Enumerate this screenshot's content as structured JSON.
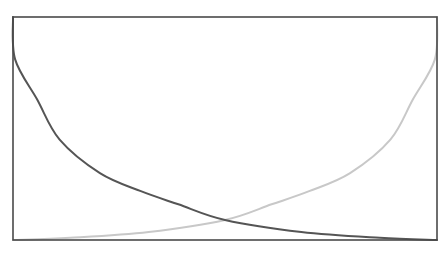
{
  "chart_data": {
    "type": "line",
    "title": "",
    "xlabel": "",
    "ylabel": "",
    "xlim": [
      0,
      1
    ],
    "ylim": [
      0,
      1
    ],
    "grid": false,
    "legend": null,
    "frame": {
      "left": 13,
      "top": 17,
      "right": 437,
      "bottom": 240,
      "color": "#4a4a4a"
    },
    "x": [
      0.0,
      0.005,
      0.057,
      0.11,
      0.205,
      0.3,
      0.39,
      0.5,
      0.68,
      0.865,
      1.0
    ],
    "series": [
      {
        "name": "decreasing",
        "color": "#555555",
        "values": [
          1.0,
          0.81,
          0.63,
          0.45,
          0.3,
          0.22,
          0.16,
          0.09,
          0.036,
          0.01,
          0.0
        ]
      },
      {
        "name": "increasing",
        "color": "#c8c8c8",
        "x": [
          0.0,
          0.135,
          0.32,
          0.5,
          0.61,
          0.7,
          0.795,
          0.89,
          0.943,
          0.995,
          1.0
        ],
        "values": [
          0.0,
          0.01,
          0.036,
          0.09,
          0.16,
          0.22,
          0.3,
          0.45,
          0.63,
          0.81,
          1.0
        ]
      }
    ],
    "annotations": []
  }
}
